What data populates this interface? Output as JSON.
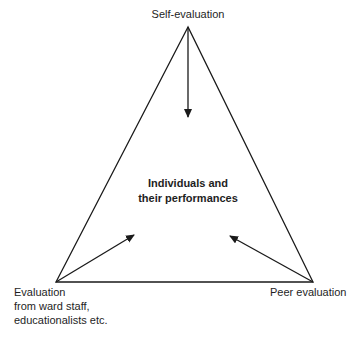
{
  "diagram": {
    "type": "triangle-evaluation-model",
    "center": {
      "lines": [
        "Individuals and",
        "their performances"
      ]
    },
    "vertices": {
      "top": {
        "label": "Self-evaluation"
      },
      "bottom_left": {
        "lines": [
          "Evaluation",
          "from ward staff,",
          "educationalists etc."
        ]
      },
      "bottom_right": {
        "label": "Peer evaluation"
      }
    },
    "geometry": {
      "apex": [
        188,
        27
      ],
      "bottom_left": [
        56,
        282
      ],
      "bottom_right": [
        313,
        282
      ],
      "arrows": [
        {
          "from": "top",
          "to": [
            188,
            118
          ]
        },
        {
          "from": "bottom_left",
          "to": [
            135,
            234
          ]
        },
        {
          "from": "bottom_right",
          "to": [
            229,
            235
          ]
        }
      ]
    },
    "colors": {
      "line": "#1a1a1a",
      "background": "#ffffff",
      "text": "#1e1e1e"
    }
  }
}
